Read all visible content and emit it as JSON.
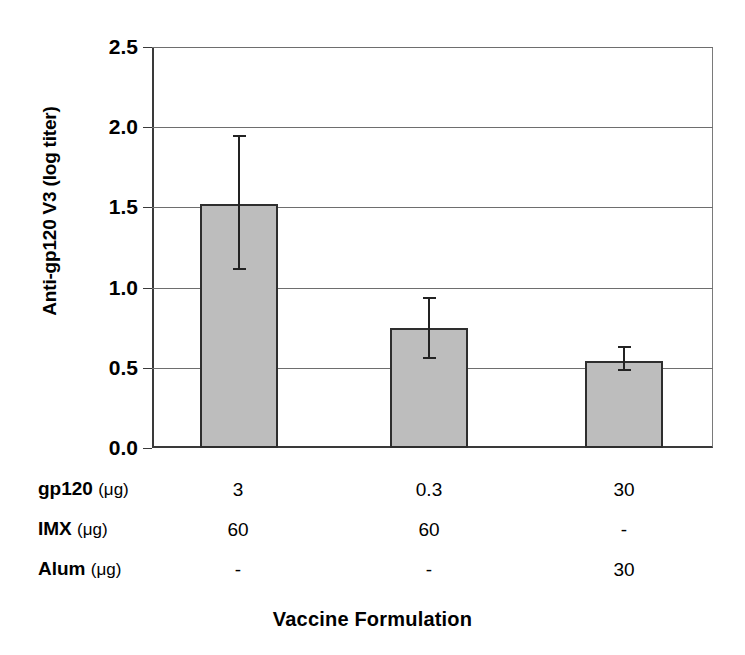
{
  "chart_data": {
    "type": "bar",
    "title": "",
    "xlabel": "Vaccine Formulation",
    "ylabel": "Anti-gp120 V3 (log titer)",
    "ylim": [
      0.0,
      2.5
    ],
    "yticks": [
      "0.0",
      "0.5",
      "1.0",
      "1.5",
      "2.0",
      "2.5"
    ],
    "ytick_values": [
      0.0,
      0.5,
      1.0,
      1.5,
      2.0,
      2.5
    ],
    "grid": true,
    "legend": "none",
    "categories": [
      "Formulation 1",
      "Formulation 2",
      "Formulation 3"
    ],
    "values": [
      1.52,
      0.75,
      0.545
    ],
    "error_upper": [
      1.95,
      0.94,
      0.635
    ],
    "error_lower": [
      1.12,
      0.57,
      0.49
    ],
    "bar_color": "#bdbdbd",
    "bar_edge_color": "#2e2e2e",
    "error_bar_color": "#232323"
  },
  "condition_table": {
    "rows": [
      {
        "label": "gp120",
        "unit": "(μg)",
        "values": [
          "3",
          "60",
          "-"
        ]
      },
      {
        "label": "IMX",
        "unit": "(μg)",
        "values": [
          "0.3",
          "60",
          "-"
        ]
      },
      {
        "label": "Alum",
        "unit": "(μg)",
        "values": [
          "30",
          "-",
          "30"
        ]
      }
    ],
    "by_row": [
      {
        "label": "gp120",
        "unit": "(μg)",
        "c1": "3",
        "c2": "0.3",
        "c3": "30"
      },
      {
        "label": "IMX",
        "unit": "(μg)",
        "c1": "60",
        "c2": "60",
        "c3": "-"
      },
      {
        "label": "Alum",
        "unit": "(μg)",
        "c1": "-",
        "c2": "-",
        "c3": "30"
      }
    ]
  }
}
